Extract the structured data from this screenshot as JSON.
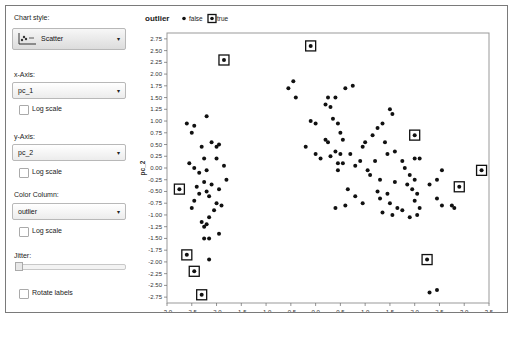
{
  "controls": {
    "chart_style": {
      "label": "Chart style:",
      "value": "Scatter",
      "icon": "scatter-chart-icon"
    },
    "x_axis": {
      "label": "x-Axis:",
      "value": "pc_1",
      "log_scale_label": "Log scale",
      "log_scale": false
    },
    "y_axis": {
      "label": "y-Axis:",
      "value": "pc_2",
      "log_scale_label": "Log scale",
      "log_scale": false
    },
    "color_column": {
      "label": "Color Column:",
      "value": "outlier",
      "log_scale_label": "Log scale",
      "log_scale": false
    },
    "jitter": {
      "label": "Jitter:",
      "value": 0
    },
    "rotate_labels": {
      "label": "Rotate labels",
      "checked": false
    },
    "dropdown_arrow": "▾"
  },
  "legend": {
    "title": "outlier",
    "items": [
      {
        "label": "false",
        "marker": "dot"
      },
      {
        "label": "true",
        "marker": "boxed-dot"
      }
    ]
  },
  "chart_data": {
    "type": "scatter",
    "title": "",
    "xlabel": "pc_1",
    "ylabel": "pc_2",
    "xlim": [
      -3.0,
      3.5
    ],
    "ylim": [
      -2.875,
      2.875
    ],
    "x_ticks": [
      "-3.0",
      "-2.5",
      "-2.0",
      "-1.5",
      "-1.0",
      "-0.5",
      "0.0",
      "0.5",
      "1.0",
      "1.5",
      "2.0",
      "2.5",
      "3.0",
      "3.5"
    ],
    "y_ticks": [
      "2.75",
      "2.50",
      "2.25",
      "2.00",
      "1.75",
      "1.50",
      "1.25",
      "1.00",
      "0.75",
      "0.50",
      "0.25",
      "0.00",
      "-0.25",
      "-0.50",
      "-0.75",
      "-1.00",
      "-1.25",
      "-1.50",
      "-1.75",
      "-2.00",
      "-2.25",
      "-2.50",
      "-2.75"
    ],
    "grid": false,
    "legend_position": "top",
    "color_by": "outlier",
    "series": [
      {
        "name": "true",
        "points": [
          [
            -0.1,
            2.6
          ],
          [
            -1.85,
            2.3
          ],
          [
            2.0,
            0.7
          ],
          [
            3.35,
            -0.05
          ],
          [
            2.9,
            -0.4
          ],
          [
            -2.75,
            -0.45
          ],
          [
            -2.6,
            -1.85
          ],
          [
            -2.45,
            -2.2
          ],
          [
            -2.3,
            -2.7
          ],
          [
            2.25,
            -1.95
          ]
        ]
      },
      {
        "name": "false",
        "points": [
          [
            -0.45,
            1.85
          ],
          [
            -0.55,
            1.7
          ],
          [
            -0.4,
            1.5
          ],
          [
            -0.1,
            1.0
          ],
          [
            0.0,
            0.95
          ],
          [
            0.25,
            1.5
          ],
          [
            0.4,
            1.5
          ],
          [
            0.6,
            1.7
          ],
          [
            0.75,
            1.75
          ],
          [
            0.2,
            1.35
          ],
          [
            0.3,
            1.3
          ],
          [
            0.35,
            1.05
          ],
          [
            0.45,
            0.95
          ],
          [
            0.5,
            0.75
          ],
          [
            0.55,
            0.6
          ],
          [
            0.2,
            0.6
          ],
          [
            0.25,
            0.55
          ],
          [
            0.4,
            0.35
          ],
          [
            0.5,
            0.3
          ],
          [
            0.45,
            0.1
          ],
          [
            0.55,
            0.1
          ],
          [
            -0.2,
            0.45
          ],
          [
            0.0,
            0.3
          ],
          [
            0.1,
            0.2
          ],
          [
            0.3,
            0.25
          ],
          [
            0.45,
            -0.05
          ],
          [
            0.8,
            0.05
          ],
          [
            0.9,
            0.15
          ],
          [
            0.7,
            0.3
          ],
          [
            0.95,
            0.45
          ],
          [
            1.0,
            0.55
          ],
          [
            1.15,
            0.7
          ],
          [
            1.25,
            0.85
          ],
          [
            1.35,
            0.95
          ],
          [
            1.5,
            1.25
          ],
          [
            1.55,
            1.15
          ],
          [
            1.4,
            0.55
          ],
          [
            1.45,
            0.3
          ],
          [
            1.6,
            0.35
          ],
          [
            1.75,
            0.15
          ],
          [
            1.8,
            0.0
          ],
          [
            1.9,
            -0.15
          ],
          [
            1.2,
            0.15
          ],
          [
            1.05,
            -0.05
          ],
          [
            1.1,
            -0.15
          ],
          [
            1.3,
            -0.25
          ],
          [
            0.65,
            -0.45
          ],
          [
            0.8,
            -0.6
          ],
          [
            0.95,
            -0.75
          ],
          [
            0.6,
            -0.8
          ],
          [
            0.4,
            -0.85
          ],
          [
            1.25,
            -0.5
          ],
          [
            1.3,
            -0.65
          ],
          [
            1.45,
            -0.55
          ],
          [
            1.5,
            -0.75
          ],
          [
            1.65,
            -0.85
          ],
          [
            1.35,
            -0.95
          ],
          [
            1.55,
            -1.0
          ],
          [
            1.75,
            -0.9
          ],
          [
            1.9,
            -1.05
          ],
          [
            2.05,
            -1.0
          ],
          [
            1.95,
            -0.45
          ],
          [
            2.0,
            -0.25
          ],
          [
            2.05,
            -0.55
          ],
          [
            2.0,
            -0.7
          ],
          [
            2.1,
            -0.85
          ],
          [
            2.3,
            -0.35
          ],
          [
            2.45,
            -0.25
          ],
          [
            2.55,
            -0.05
          ],
          [
            2.45,
            -0.65
          ],
          [
            2.55,
            -0.8
          ],
          [
            2.0,
            0.2
          ],
          [
            2.1,
            0.2
          ],
          [
            1.6,
            -0.3
          ],
          [
            1.85,
            -0.35
          ],
          [
            2.3,
            -2.65
          ],
          [
            2.45,
            -2.6
          ],
          [
            2.75,
            -0.8
          ],
          [
            2.8,
            -0.85
          ],
          [
            -2.2,
            1.1
          ],
          [
            -2.45,
            0.9
          ],
          [
            -2.6,
            0.95
          ],
          [
            -2.5,
            0.75
          ],
          [
            -2.1,
            0.55
          ],
          [
            -1.95,
            0.5
          ],
          [
            -2.0,
            0.45
          ],
          [
            -2.3,
            0.45
          ],
          [
            -2.25,
            0.2
          ],
          [
            -2.55,
            0.1
          ],
          [
            -2.45,
            0.0
          ],
          [
            -2.35,
            -0.1
          ],
          [
            -2.2,
            -0.05
          ],
          [
            -2.0,
            0.2
          ],
          [
            -1.85,
            0.05
          ],
          [
            -2.25,
            -0.3
          ],
          [
            -2.4,
            -0.4
          ],
          [
            -2.35,
            -0.55
          ],
          [
            -2.2,
            -0.5
          ],
          [
            -2.1,
            -0.35
          ],
          [
            -1.95,
            -0.45
          ],
          [
            -2.15,
            -0.6
          ],
          [
            -2.5,
            -0.85
          ],
          [
            -2.0,
            -0.75
          ],
          [
            -2.05,
            -0.9
          ],
          [
            -1.9,
            -0.8
          ],
          [
            -2.3,
            -1.15
          ],
          [
            -2.25,
            -1.25
          ],
          [
            -2.15,
            -1.05
          ],
          [
            -2.2,
            -1.2
          ],
          [
            -2.25,
            -1.5
          ],
          [
            -2.15,
            -1.5
          ],
          [
            -1.95,
            -1.4
          ],
          [
            -2.15,
            -1.95
          ],
          [
            -2.45,
            -0.7
          ],
          [
            -1.8,
            -0.25
          ]
        ]
      }
    ]
  }
}
